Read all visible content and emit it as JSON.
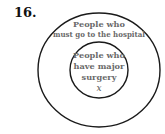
{
  "problem_number": "16.",
  "diagram": {
    "type": "euler",
    "outer_set": {
      "label_line1": "People who",
      "label_line2": "must go to the hospital"
    },
    "inner_set": {
      "label_line1": "People who",
      "label_line2": "have major",
      "label_line3": "surgery",
      "element": "x"
    }
  }
}
